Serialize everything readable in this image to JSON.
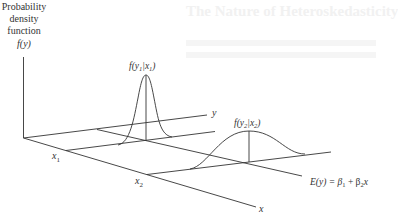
{
  "background_ghost": {
    "title": "The Nature of Heteroskedasticity"
  },
  "figure": {
    "vertical_axis_label_lines": [
      "Probability",
      "density",
      "function",
      "f(y)"
    ],
    "y_axis_label": "y",
    "x_axis_label": "x",
    "x1_label": "x",
    "x1_sub": "1",
    "x2_label": "x",
    "x2_sub": "2",
    "curve1_label": {
      "f": "f(y",
      "sub1": "1",
      "mid": "|x",
      "sub2": "1",
      "end": ")"
    },
    "curve2_label": {
      "f": "f(y",
      "sub1": "2",
      "mid": "|x",
      "sub2": "2",
      "end": ")"
    },
    "regression_label": {
      "a": "E(y) = β",
      "s1": "1",
      "b": " + β",
      "s2": "2",
      "c": "x"
    },
    "line_color": "#333333"
  }
}
